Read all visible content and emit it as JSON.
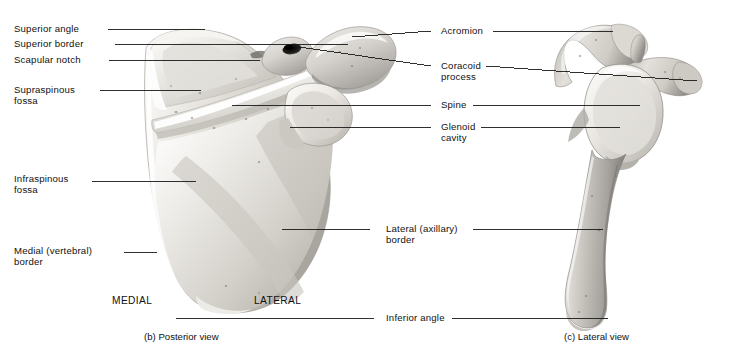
{
  "figure": {
    "background_color": "#ffffff",
    "line_color": "#1a1a1a",
    "text_color": "#111111"
  },
  "labels_left": [
    {
      "id": "superior-angle",
      "text": "Superior angle",
      "text2": "",
      "x": 14,
      "y": 23,
      "line_x1": 108,
      "line_y1": 29,
      "line_x2": 205,
      "line_y2": 29
    },
    {
      "id": "superior-border",
      "text": "Superior border",
      "text2": "",
      "x": 14,
      "y": 38,
      "line_x1": 115,
      "line_y1": 44,
      "line_x2": 348,
      "line_y2": 44
    },
    {
      "id": "scapular-notch",
      "text": "Scapular notch",
      "text2": "",
      "x": 14,
      "y": 54,
      "line_x1": 109,
      "line_y1": 60,
      "line_x2": 260,
      "line_y2": 60
    },
    {
      "id": "supraspinous-fossa",
      "text": "Supraspinous",
      "text2": "fossa",
      "x": 14,
      "y": 84,
      "line_x1": 100,
      "line_y1": 90,
      "line_x2": 201,
      "line_y2": 90
    },
    {
      "id": "infraspinous-fossa",
      "text": "Infraspinous",
      "text2": "fossa",
      "x": 14,
      "y": 173,
      "line_x1": 92,
      "line_y1": 181,
      "line_x2": 196,
      "line_y2": 181
    },
    {
      "id": "medial-border",
      "text": "Medial (vertebral)",
      "text2": "border",
      "x": 14,
      "y": 245,
      "line_x1": 124,
      "line_y1": 252,
      "line_x2": 157,
      "line_y2": 252
    }
  ],
  "labels_right": [
    {
      "id": "acromion",
      "text": "Acromion",
      "text2": "",
      "x": 441,
      "y": 25,
      "line_x1": 431,
      "line_y1": 31,
      "line_x2": 352,
      "line_y2": 37,
      "line2_x1": 493,
      "line2_y1": 31,
      "line2_x2": 613,
      "line2_y2": 31
    },
    {
      "id": "coracoid-process",
      "text": "Coracoid",
      "text2": "process",
      "x": 441,
      "y": 60,
      "line_x1": 431,
      "line_y1": 66,
      "line_x2": 292,
      "line_y2": 46,
      "line2_x1": 486,
      "line2_y1": 66,
      "line2_x2": 697,
      "line2_y2": 81
    },
    {
      "id": "spine",
      "text": "Spine",
      "text2": "",
      "x": 441,
      "y": 99,
      "line_x1": 431,
      "line_y1": 105,
      "line_x2": 232,
      "line_y2": 105,
      "line2_x1": 473,
      "line2_y1": 105,
      "line2_x2": 640,
      "line2_y2": 105
    },
    {
      "id": "glenoid-cavity",
      "text": "Glenoid",
      "text2": "cavity",
      "x": 441,
      "y": 121,
      "line_x1": 431,
      "line_y1": 127,
      "line_x2": 290,
      "line_y2": 127,
      "line2_x1": 481,
      "line2_y1": 127,
      "line2_x2": 620,
      "line2_y2": 127
    },
    {
      "id": "lateral-border",
      "text": "Lateral (axillary)",
      "text2": "border",
      "x": 386,
      "y": 223,
      "line_x1": 370,
      "line_y1": 229,
      "line_x2": 282,
      "line_y2": 229,
      "line2_x1": 473,
      "line2_y1": 229,
      "line2_x2": 603,
      "line2_y2": 229
    },
    {
      "id": "inferior-angle",
      "text": "Inferior angle",
      "text2": "",
      "x": 386,
      "y": 312,
      "line_x1": 374,
      "line_y1": 318,
      "line_x2": 176,
      "line_y2": 318,
      "line2_x1": 452,
      "line2_y1": 318,
      "line2_x2": 608,
      "line2_y2": 318
    }
  ],
  "orientation": {
    "medial": "MEDIAL",
    "medial_x": 112,
    "medial_y": 295,
    "lateral": "LATERAL",
    "lateral_x": 254,
    "lateral_y": 295
  },
  "captions": [
    {
      "id": "posterior-view",
      "text": "(b) Posterior view",
      "x": 144,
      "y": 331
    },
    {
      "id": "lateral-view",
      "text": "(c) Lateral view",
      "x": 564,
      "y": 331
    }
  ],
  "bone_palette": {
    "highlight": "#fdfdfc",
    "light": "#eceae6",
    "mid": "#d2cfc9",
    "shade": "#b4b1ab",
    "dark": "#8e8b86",
    "deep": "#5f5d59",
    "outline": "#9a9792",
    "socket": "#171717"
  }
}
